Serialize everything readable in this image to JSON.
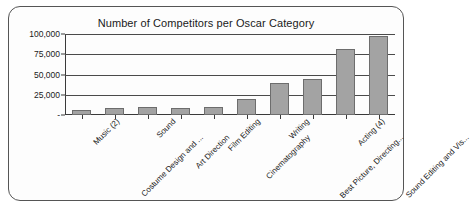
{
  "chart_data": {
    "type": "bar",
    "title": "Number of Competitors per Oscar Category",
    "xlabel": "",
    "ylabel": "",
    "ylim": [
      0,
      100000
    ],
    "grid": true,
    "legend": "none",
    "categories": [
      "Music (2)",
      "Costume Design and ...",
      "Sound",
      "Art Direction",
      "Film Editing",
      "Cinematography",
      "Writing",
      "Best Picture, Directing...",
      "Acting (4)",
      "Sound Editing and Vis..."
    ],
    "values": [
      6500,
      8500,
      9500,
      9000,
      10000,
      20000,
      39000,
      44000,
      81000,
      98000
    ],
    "ytick_labels": [
      "100,000",
      "75,000",
      "50,000",
      "25,000",
      "-"
    ],
    "ytick_values": [
      100000,
      75000,
      50000,
      25000,
      0
    ],
    "series": [
      {
        "name": "Competitors",
        "values": [
          6500,
          8500,
          9500,
          9000,
          10000,
          20000,
          39000,
          44000,
          81000,
          98000
        ]
      }
    ],
    "colors": {
      "bar_fill": "#a3a3a3",
      "bar_border": "#6d6d6d",
      "axis": "#3a3a3a",
      "grid": "#4a4a4a",
      "frame": "#555555",
      "text": "#1a1a1a",
      "background": "#fdfdfd"
    }
  }
}
